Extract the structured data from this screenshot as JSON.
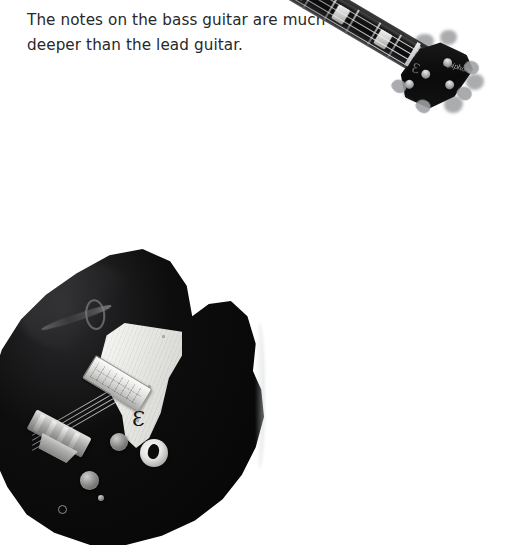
{
  "slide": {
    "background_color": "#ffffff",
    "caption": {
      "text": "The notes on the bass guitar are much\ndeeper than the lead guitar.",
      "line_1": "The notes on the bass guitar are much",
      "line_2": "deeper than the lead guitar.",
      "color": "#27282b"
    }
  },
  "photo": {
    "subject": "electric bass guitar",
    "style": "black-and-white photograph",
    "orientation": "diagonal, headstock upper-right, body lower-left",
    "colors": {
      "body": "#0a0a0a",
      "hardware_chrome": "#cfd0cd",
      "pickguard": "#f2f2f0",
      "fretboard": "#131314",
      "tuner_grey": "#9ea0a3"
    },
    "headstock": {
      "brand_logo": "Epiphone",
      "epsilon_mark": "Ɛ",
      "tuner_count": 4
    },
    "neck": {
      "fret_count": 16,
      "inlay_count": 6,
      "string_count": 4
    },
    "body": {
      "type": "semi-hollow double-cutaway",
      "f_hole": true,
      "pickguard_logo": "Ɛ",
      "pickup_count": 1,
      "knob_count": 3,
      "output_jack": true,
      "strap_button": true,
      "cropped_at_bottom": true
    }
  }
}
